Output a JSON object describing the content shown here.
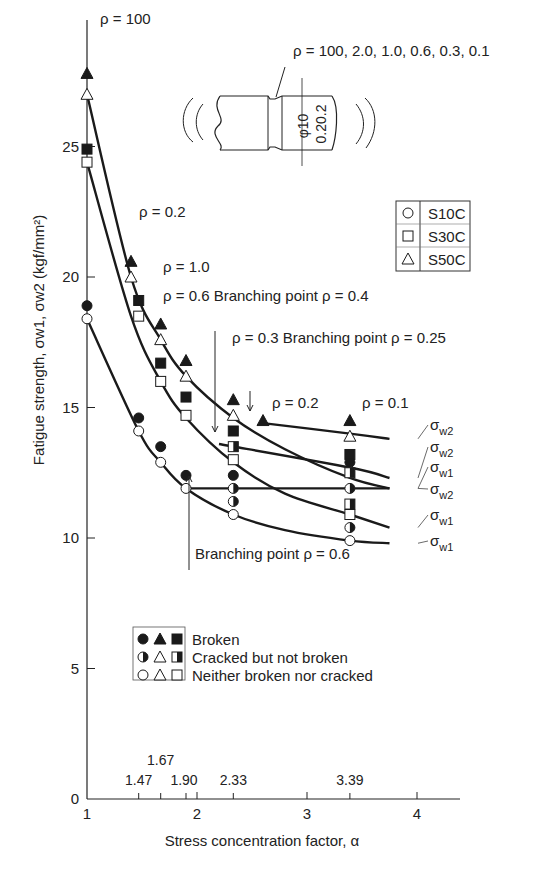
{
  "chart_data": {
    "type": "scatter",
    "title": "",
    "xlabel": "Stress concentration factor, α",
    "ylabel": "Fatigue strength, σw1, σw2 (kgf/mm²)",
    "xlim": [
      1,
      4.3
    ],
    "ylim": [
      0,
      28
    ],
    "grid": false,
    "x_ticks": [
      "1",
      "2",
      "3",
      "4"
    ],
    "y_ticks": [
      "0",
      "5",
      "10",
      "15",
      "20",
      "25"
    ],
    "minor_x_ticks": [
      1.47,
      1.67,
      1.9,
      2.33,
      3.39
    ],
    "minor_x_tick_labels": [
      "1.47",
      "1.67",
      "1.90",
      "2.33",
      "3.39"
    ],
    "legend_material": {
      "position": "upper right",
      "entries": [
        {
          "marker": "circle",
          "label": "S10C"
        },
        {
          "marker": "square",
          "label": "S30C"
        },
        {
          "marker": "triangle",
          "label": "S50C"
        }
      ]
    },
    "legend_state": {
      "position": "lower left",
      "entries": [
        {
          "fill": "filled",
          "label": "Broken"
        },
        {
          "fill": "half",
          "label": "Cracked but not broken"
        },
        {
          "fill": "open",
          "label": "Neither broken nor cracked"
        }
      ]
    },
    "specimen": {
      "rho_label": "ρ = 100, 2.0, 1.0, 0.6, 0.3, 0.1",
      "dim_diameter": "φ10",
      "dim_depth": "0.20.2"
    },
    "annotations": [
      {
        "text": "ρ = 100",
        "x": 1.0,
        "y": 27.8
      },
      {
        "text": "ρ = 0.2",
        "x": 1.4,
        "y": 20.6
      },
      {
        "text": "ρ = 1.0",
        "x": 1.67,
        "y": 18.2
      },
      {
        "text": "ρ = 0.6 Branching point ρ = 0.4",
        "x": 1.67,
        "y": 17.4
      },
      {
        "text": "ρ = 0.3 Branching point ρ = 0.25",
        "x": 2.2,
        "y": 15.7
      },
      {
        "text": "ρ = 0.2",
        "x": 2.6,
        "y": 14.5
      },
      {
        "text": "ρ = 0.1",
        "x": 3.39,
        "y": 14.5
      },
      {
        "text": "Branching point ρ = 0.6",
        "x": 1.9,
        "y": 9.0
      }
    ],
    "series": [
      {
        "name": "S10C broken",
        "marker": "circle",
        "fill": "filled",
        "x": [
          1.0,
          1.47,
          1.67,
          1.9,
          2.33,
          3.39
        ],
        "y": [
          18.9,
          14.6,
          13.5,
          12.4,
          12.4,
          12.9
        ]
      },
      {
        "name": "S10C cracked",
        "marker": "circle",
        "fill": "half",
        "x": [
          2.33,
          3.39,
          2.33,
          3.39
        ],
        "y": [
          11.9,
          11.9,
          11.4,
          10.4
        ]
      },
      {
        "name": "S10C neither",
        "marker": "circle",
        "fill": "open",
        "x": [
          1.0,
          1.47,
          1.67,
          1.9,
          2.33,
          3.39
        ],
        "y": [
          18.4,
          14.1,
          12.9,
          11.9,
          10.9,
          9.9
        ]
      },
      {
        "name": "S30C broken",
        "marker": "square",
        "fill": "filled",
        "x": [
          1.0,
          1.47,
          1.67,
          1.9,
          2.33,
          3.39
        ],
        "y": [
          24.9,
          19.1,
          16.7,
          15.4,
          14.1,
          13.2
        ]
      },
      {
        "name": "S30C cracked",
        "marker": "square",
        "fill": "half",
        "x": [
          2.33,
          3.39,
          3.39
        ],
        "y": [
          13.5,
          12.5,
          11.3
        ]
      },
      {
        "name": "S30C neither",
        "marker": "square",
        "fill": "open",
        "x": [
          1.0,
          1.47,
          1.67,
          1.9,
          2.33,
          3.39
        ],
        "y": [
          24.4,
          18.5,
          16.0,
          14.7,
          13.0,
          10.9
        ]
      },
      {
        "name": "S50C broken",
        "marker": "triangle",
        "fill": "filled",
        "x": [
          1.0,
          1.4,
          1.67,
          1.9,
          2.33,
          2.6,
          3.39
        ],
        "y": [
          27.8,
          20.6,
          18.2,
          16.8,
          15.3,
          14.5,
          14.5
        ]
      },
      {
        "name": "S50C neither",
        "marker": "triangle",
        "fill": "open",
        "x": [
          1.0,
          1.4,
          1.67,
          1.9,
          2.33,
          3.39
        ],
        "y": [
          27.0,
          20.0,
          17.6,
          16.2,
          14.7,
          13.9
        ]
      }
    ],
    "curves": [
      {
        "name": "S50C σw1 (upper crack-initiation curve)",
        "label": "σw1",
        "x": [
          1.0,
          1.4,
          1.67,
          1.9,
          2.33,
          2.8,
          3.39,
          3.75
        ],
        "y": [
          27.0,
          20.0,
          17.6,
          16.2,
          14.6,
          13.4,
          12.3,
          11.9
        ]
      },
      {
        "name": "S50C σw2",
        "label": "σw2",
        "x": [
          2.6,
          3.39,
          3.75
        ],
        "y": [
          14.4,
          14.0,
          13.8
        ]
      },
      {
        "name": "S30C σw1",
        "label": "σw1",
        "x": [
          1.0,
          1.4,
          1.67,
          1.9,
          2.33,
          2.8,
          3.39,
          3.75
        ],
        "y": [
          24.4,
          18.5,
          16.0,
          14.6,
          12.9,
          11.7,
          10.9,
          10.4
        ]
      },
      {
        "name": "S30C σw2",
        "label": "σw2",
        "x": [
          2.2,
          3.39,
          3.75
        ],
        "y": [
          13.6,
          12.7,
          12.3
        ]
      },
      {
        "name": "S10C σw1",
        "label": "σw1",
        "x": [
          1.0,
          1.47,
          1.67,
          1.9,
          2.33,
          2.8,
          3.39,
          3.75
        ],
        "y": [
          18.4,
          14.1,
          12.9,
          11.9,
          10.9,
          10.3,
          9.9,
          9.8
        ]
      },
      {
        "name": "S10C σw2",
        "label": "σw2",
        "x": [
          1.9,
          3.39,
          3.75
        ],
        "y": [
          11.9,
          11.9,
          11.9
        ]
      }
    ],
    "right_labels": [
      "σw2",
      "σw2",
      "σw1",
      "σw2",
      "σw1",
      "σw1"
    ]
  }
}
